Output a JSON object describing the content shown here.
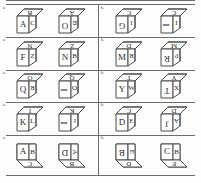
{
  "sheet": {
    "kind": "cube-rotation-worksheet",
    "rows": 5,
    "columns": 2,
    "ink_color": "#4a4a4a",
    "rule_color": "#6c6c6c",
    "background": "#fdfdfd"
  },
  "items": [
    {
      "label": "a.",
      "cubes": [
        {
          "view": "above",
          "faces": {
            "left": {
              "glyph": "A",
              "rotation": 0
            },
            "right": {
              "glyph": "C",
              "rotation": 0
            },
            "top": {
              "glyph": "B",
              "rotation": 180
            }
          }
        },
        {
          "view": "above",
          "faces": {
            "left": {
              "glyph": "O",
              "rotation": 180
            },
            "right": {
              "glyph": "B",
              "rotation": 90
            },
            "top": {
              "glyph": "A",
              "rotation": 180
            }
          }
        }
      ]
    },
    {
      "label": "b.",
      "cubes": [
        {
          "view": "above",
          "faces": {
            "left": {
              "glyph": "G",
              "rotation": 180
            },
            "right": {
              "glyph": "I",
              "rotation": 0
            },
            "top": {
              "glyph": "C",
              "rotation": 180
            }
          }
        },
        {
          "view": "above",
          "faces": {
            "left": {
              "glyph": "I",
              "rotation": 270
            },
            "right": {
              "glyph": "I",
              "rotation": 0
            },
            "top": {
              "glyph": "C",
              "rotation": 180
            }
          }
        }
      ]
    },
    {
      "label": "a.",
      "cubes": [
        {
          "view": "above",
          "faces": {
            "left": {
              "glyph": "F",
              "rotation": 0
            },
            "right": {
              "glyph": "Z",
              "rotation": 0
            },
            "top": {
              "glyph": "N",
              "rotation": 180
            }
          }
        },
        {
          "view": "above",
          "faces": {
            "left": {
              "glyph": "N",
              "rotation": 0
            },
            "right": {
              "glyph": "B",
              "rotation": 0
            },
            "top": {
              "glyph": "Z",
              "rotation": 180
            }
          }
        }
      ]
    },
    {
      "label": "b.",
      "cubes": [
        {
          "view": "above",
          "faces": {
            "left": {
              "glyph": "M",
              "rotation": 0
            },
            "right": {
              "glyph": "R",
              "rotation": 180
            },
            "top": {
              "glyph": "D",
              "rotation": 180
            }
          }
        },
        {
          "view": "above",
          "faces": {
            "left": {
              "glyph": "R",
              "rotation": 180
            },
            "right": {
              "glyph": "d",
              "rotation": 0
            },
            "top": {
              "glyph": "M",
              "rotation": 180
            }
          }
        }
      ]
    },
    {
      "label": "a.",
      "cubes": [
        {
          "view": "above",
          "faces": {
            "left": {
              "glyph": "Q",
              "rotation": 0
            },
            "right": {
              "glyph": "R",
              "rotation": 180
            },
            "top": {
              "glyph": "O",
              "rotation": 180
            }
          }
        },
        {
          "view": "above",
          "faces": {
            "left": {
              "glyph": "I",
              "rotation": 270
            },
            "right": {
              "glyph": "O",
              "rotation": 0
            },
            "top": {
              "glyph": "Q",
              "rotation": 180
            }
          }
        }
      ]
    },
    {
      "label": "b.",
      "cubes": [
        {
          "view": "above",
          "faces": {
            "left": {
              "glyph": "Y",
              "rotation": 0
            },
            "right": {
              "glyph": "W",
              "rotation": 0
            },
            "top": {
              "glyph": "T",
              "rotation": 180
            }
          }
        },
        {
          "view": "above",
          "faces": {
            "left": {
              "glyph": "T",
              "rotation": 180
            },
            "right": {
              "glyph": "X",
              "rotation": 0
            },
            "top": {
              "glyph": "Y",
              "rotation": 180
            }
          }
        }
      ]
    },
    {
      "label": "a.",
      "cubes": [
        {
          "view": "above",
          "faces": {
            "left": {
              "glyph": "K",
              "rotation": 0
            },
            "right": {
              "glyph": "L",
              "rotation": 0
            },
            "top": {
              "glyph": "I",
              "rotation": 180
            }
          }
        },
        {
          "view": "above",
          "faces": {
            "left": {
              "glyph": "I",
              "rotation": 270
            },
            "right": {
              "glyph": "J",
              "rotation": 0
            },
            "top": {
              "glyph": "K",
              "rotation": 180
            }
          }
        }
      ]
    },
    {
      "label": "b.",
      "cubes": [
        {
          "view": "above",
          "faces": {
            "left": {
              "glyph": "D",
              "rotation": 0
            },
            "right": {
              "glyph": "E",
              "rotation": 0
            },
            "top": {
              "glyph": "C",
              "rotation": 180
            }
          }
        },
        {
          "view": "above",
          "faces": {
            "left": {
              "glyph": "J",
              "rotation": 180
            },
            "right": {
              "glyph": "A",
              "rotation": 180
            },
            "top": {
              "glyph": "D",
              "rotation": 180
            }
          }
        }
      ]
    },
    {
      "label": "a.",
      "cubes": [
        {
          "view": "below",
          "faces": {
            "left": {
              "glyph": "A",
              "rotation": 0
            },
            "right": {
              "glyph": "B",
              "rotation": 0
            },
            "bottom": {
              "glyph": "C",
              "rotation": 180
            }
          }
        },
        {
          "view": "below",
          "faces": {
            "left": {
              "glyph": "D",
              "rotation": 180
            },
            "right": {
              "glyph": "A",
              "rotation": 90
            },
            "bottom": {
              "glyph": "B",
              "rotation": 180
            }
          }
        }
      ]
    },
    {
      "label": "b.",
      "cubes": [
        {
          "view": "below",
          "faces": {
            "left": {
              "glyph": "B",
              "rotation": 180
            },
            "right": {
              "glyph": "E",
              "rotation": 90
            },
            "bottom": {
              "glyph": "D",
              "rotation": 180
            }
          }
        },
        {
          "view": "below",
          "faces": {
            "left": {
              "glyph": "C",
              "rotation": 0
            },
            "right": {
              "glyph": "B",
              "rotation": 0
            },
            "bottom": {
              "glyph": "E",
              "rotation": 180
            }
          }
        }
      ]
    }
  ]
}
